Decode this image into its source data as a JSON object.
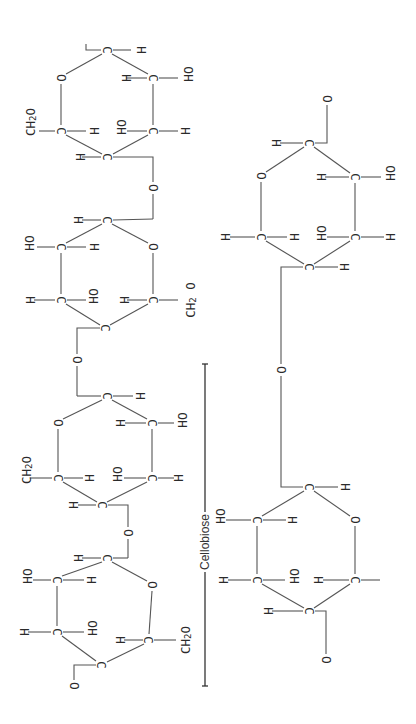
{
  "diagram": {
    "orientation": "rotated 90 degrees clockwise",
    "colors": {
      "ink": "#2a2a2a",
      "bond": "#555555",
      "background": "#ffffff"
    },
    "bracket_label": "Cellobiose",
    "symbols": {
      "carbon": "C",
      "hydrogen": "H",
      "oxygen": "O",
      "hydroxyl": "OH",
      "hydroxymethyl": "CH2O",
      "hydroxymethyl_sub": "2"
    },
    "chain_units": [
      {
        "name": "glucose-unit-1",
        "ring_oxygen": "O",
        "substituents": [
          "H",
          "OH",
          "H",
          "OH",
          "H",
          "CH2O",
          "H"
        ]
      },
      {
        "name": "glucose-unit-2",
        "ring_oxygen": "O",
        "substituents": [
          "H",
          "OH",
          "H",
          "OH",
          "H",
          "CH2O",
          "H"
        ]
      },
      {
        "name": "glucose-unit-3",
        "ring_oxygen": "O",
        "substituents": [
          "H",
          "OH",
          "H",
          "OH",
          "H",
          "CH2O",
          "H"
        ]
      },
      {
        "name": "glucose-unit-4",
        "ring_oxygen": "O",
        "substituents": [
          "H",
          "OH",
          "H",
          "OH",
          "H",
          "CH2O",
          "H"
        ]
      }
    ],
    "cellobiose_units": [
      {
        "name": "cellobiose-top-ring",
        "substituents": [
          "H",
          "OH",
          "H",
          "OH",
          "H",
          "H",
          "H"
        ]
      },
      {
        "name": "cellobiose-bottom-ring",
        "substituents": [
          "H",
          "OH",
          "H",
          "OH",
          "H",
          "H",
          "H"
        ]
      }
    ]
  }
}
